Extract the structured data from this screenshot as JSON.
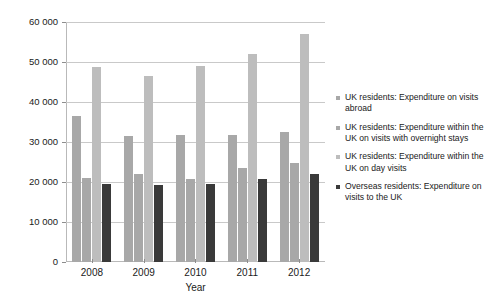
{
  "chart_data": {
    "type": "bar",
    "title": "",
    "subtitle": "",
    "xlabel": "Year",
    "ylabel": "",
    "categories": [
      "2008",
      "2009",
      "2010",
      "2011",
      "2012"
    ],
    "ylim": [
      0,
      60000
    ],
    "yticks": [
      0,
      10000,
      20000,
      30000,
      40000,
      50000,
      60000
    ],
    "ytick_labels": [
      "0",
      "10 000",
      "20 000",
      "30 000",
      "40 000",
      "50 000",
      "60 000"
    ],
    "grid": true,
    "legend_position": "right",
    "series": [
      {
        "name": "UK residents: Expenditure on visits abroad",
        "color": "#a8a8a8",
        "values": [
          36500,
          31600,
          31800,
          31800,
          32500
        ]
      },
      {
        "name": "UK residents: Expenditure within the UK on visits with overnight stays",
        "color": "#a8a8a8",
        "values": [
          21000,
          22000,
          20700,
          23600,
          24700
        ]
      },
      {
        "name": "UK residents: Expenditure within the UK on day visits",
        "color": "#bdbdbd",
        "values": [
          48800,
          46400,
          48900,
          52100,
          57000
        ]
      },
      {
        "name": "Overseas residents: Expenditure on visits to the UK",
        "color": "#3a3a3a",
        "values": [
          19500,
          19200,
          19600,
          20800,
          21900
        ]
      }
    ]
  },
  "legend": {
    "items": [
      {
        "label": "UK residents: Expenditure on visits abroad"
      },
      {
        "label": "UK residents: Expenditure within the UK on visits with overnight stays"
      },
      {
        "label": "UK residents: Expenditure within the UK on day visits"
      },
      {
        "label": "Overseas residents: Expenditure on visits to the UK"
      }
    ]
  }
}
